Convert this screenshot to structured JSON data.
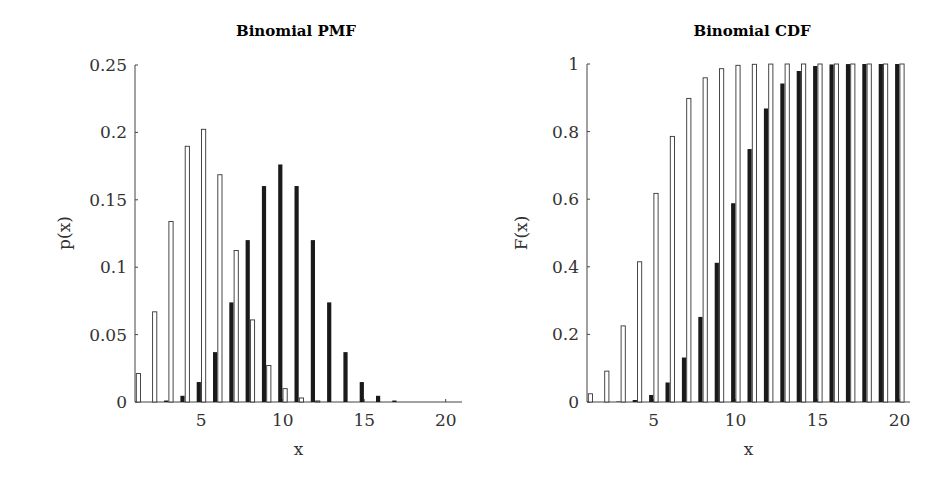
{
  "chart_data": [
    {
      "type": "bar",
      "title": "Binomial PMF",
      "xlabel": "x",
      "ylabel": "p(x)",
      "xlim": [
        1,
        21
      ],
      "ylim": [
        0,
        0.25
      ],
      "xticks": [
        5,
        10,
        15,
        20
      ],
      "yticks": [
        "0",
        "0.05",
        "0.1",
        "0.15",
        "0.2",
        "0.25"
      ],
      "grid": false,
      "legend": null,
      "x": [
        1,
        2,
        3,
        4,
        5,
        6,
        7,
        8,
        9,
        10,
        11,
        12,
        13,
        14,
        15,
        16,
        17,
        18,
        19,
        20
      ],
      "series": [
        {
          "name": "Binomial(20, 0.5)",
          "style": "filled-black",
          "values": [
            2e-05,
            0.0002,
            0.0011,
            0.0046,
            0.0148,
            0.037,
            0.0739,
            0.1201,
            0.1602,
            0.1762,
            0.1602,
            0.1201,
            0.0739,
            0.037,
            0.0148,
            0.0046,
            0.0011,
            0.0002,
            2e-05,
            1e-06
          ]
        },
        {
          "name": "Binomial(20, 0.25)",
          "style": "outline-white",
          "values": [
            0.0211,
            0.0669,
            0.1339,
            0.1897,
            0.2023,
            0.1686,
            0.1124,
            0.0609,
            0.0271,
            0.0099,
            0.003,
            0.0008,
            0.0002,
            3e-05,
            0,
            0,
            0,
            0,
            0,
            0
          ]
        }
      ]
    },
    {
      "type": "bar",
      "title": "Binomial CDF",
      "xlabel": "x",
      "ylabel": "F(x)",
      "xlim": [
        1,
        21
      ],
      "ylim": [
        0,
        1
      ],
      "xticks": [
        5,
        10,
        15,
        20
      ],
      "yticks": [
        "0",
        "0.2",
        "0.4",
        "0.6",
        "0.8",
        "1"
      ],
      "grid": false,
      "legend": null,
      "x": [
        1,
        2,
        3,
        4,
        5,
        6,
        7,
        8,
        9,
        10,
        11,
        12,
        13,
        14,
        15,
        16,
        17,
        18,
        19,
        20
      ],
      "series": [
        {
          "name": "Binomial(20, 0.5)",
          "style": "filled-black",
          "values": [
            2e-05,
            0.0002,
            0.0013,
            0.0059,
            0.0207,
            0.0577,
            0.1316,
            0.2517,
            0.4119,
            0.5881,
            0.7483,
            0.8684,
            0.9423,
            0.9793,
            0.9941,
            0.9987,
            0.9998,
            1,
            1,
            1
          ]
        },
        {
          "name": "Binomial(20, 0.25)",
          "style": "outline-white",
          "values": [
            0.0243,
            0.0913,
            0.2252,
            0.4148,
            0.6172,
            0.7858,
            0.8982,
            0.9591,
            0.9861,
            0.9961,
            0.9991,
            0.9998,
            1,
            1,
            1,
            1,
            1,
            1,
            1,
            1
          ]
        }
      ]
    }
  ],
  "colors": {
    "filled": "#1a1a1a",
    "outline": "#333333",
    "axis": "#444444"
  }
}
